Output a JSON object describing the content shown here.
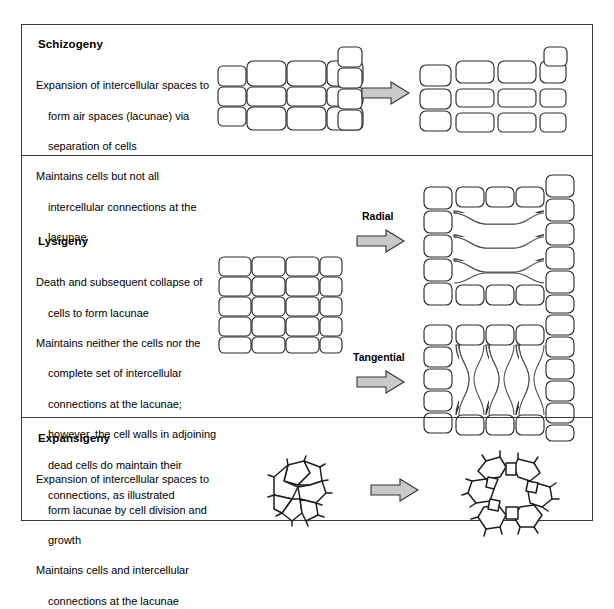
{
  "figure": {
    "type": "diagram",
    "border_color": "#3a3a3a",
    "arrow_fill": "#c9c9c9",
    "arrow_stroke": "#333333",
    "collapsed_wall_fill": "#ececec"
  },
  "sections": [
    {
      "id": "schizogeny",
      "title": "Schizogeny",
      "description_lines": [
        {
          "text": "Expansion of intercellular spaces to",
          "indent": false
        },
        {
          "text": "form air spaces (lacunae) via",
          "indent": true
        },
        {
          "text": "separation of cells",
          "indent": true
        },
        {
          "text": "Maintains cells but not all",
          "indent": false
        },
        {
          "text": "intercellular connections at the",
          "indent": true
        },
        {
          "text": "lacunae",
          "indent": true
        }
      ],
      "transitions": [
        {
          "label": "",
          "before": "intact cell grid, cells touching",
          "after": "cell grid with separated cells forming lacunae"
        }
      ]
    },
    {
      "id": "lysigeny",
      "title": "Lysigeny",
      "description_lines": [
        {
          "text": "Death and subsequent collapse of",
          "indent": false
        },
        {
          "text": "cells to form lacunae",
          "indent": true
        },
        {
          "text": "Maintains neither the cells nor the",
          "indent": false
        },
        {
          "text": "complete set of intercellular",
          "indent": true
        },
        {
          "text": "connections at the lacunae;",
          "indent": true
        },
        {
          "text": "however, the cell walls in adjoining",
          "indent": true
        },
        {
          "text": "dead cells do maintain their",
          "indent": true
        },
        {
          "text": "connections, as illustrated",
          "indent": true
        }
      ],
      "transitions": [
        {
          "label": "Radial",
          "before": "intact cell grid",
          "after": "horizontally collapsed cell walls forming radial lacunae"
        },
        {
          "label": "Tangential",
          "before": "intact cell grid",
          "after": "vertically collapsed cell walls forming tangential lacunae"
        }
      ]
    },
    {
      "id": "expansigeny",
      "title": "Expansigeny",
      "description_lines": [
        {
          "text": "Expansion of intercellular spaces to",
          "indent": false
        },
        {
          "text": "form lacunae by cell division and",
          "indent": true
        },
        {
          "text": "growth",
          "indent": true
        },
        {
          "text": "Maintains cells and intercellular",
          "indent": false
        },
        {
          "text": "connections at the lacunae",
          "indent": true
        }
      ],
      "transitions": [
        {
          "label": "",
          "before": "compact polygonal cell cluster",
          "after": "ring of polygonal cells around a central lacuna"
        }
      ]
    }
  ]
}
